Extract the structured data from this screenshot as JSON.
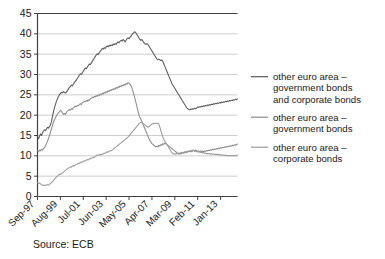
{
  "source_note": "Source: ECB",
  "chart_data": {
    "type": "line",
    "title": "",
    "subtitle": "",
    "xlabel": "",
    "ylabel": "",
    "ylim": [
      0,
      45
    ],
    "ytick_values": [
      0,
      5,
      10,
      15,
      20,
      25,
      30,
      35,
      40,
      45
    ],
    "ytick_labels": [
      "0",
      "5",
      "10",
      "15",
      "20",
      "25",
      "30",
      "35",
      "40",
      "45"
    ],
    "xtick_labels": [
      "Sep-97",
      "Aug-99",
      "Jul-01",
      "Jun-03",
      "May-05",
      "Apr-07",
      "Mar-09",
      "Feb-11",
      "Jan-13"
    ],
    "xtick_indices": [
      0,
      23,
      46,
      69,
      92,
      115,
      138,
      161,
      184
    ],
    "x_start_label": "Sep-97",
    "x_end_label": "mid-2014",
    "n_points": 202,
    "grid": true,
    "grid_axis": "y",
    "legend_position": "right",
    "colors": {
      "series_1": "#595959",
      "series_2": "#8c8c8c",
      "series_3": "#9a9a9a",
      "gridline": "#c8c8c8",
      "axis": "#404040",
      "background": "#ffffff"
    },
    "series": [
      {
        "name": "other euro area – government bonds and corporate bonds",
        "legend_label_lines": [
          "other euro area –",
          "government bonds",
          "and corporate bonds"
        ],
        "color": "#595959",
        "values": [
          14.6,
          14.2,
          14.8,
          15.4,
          15.0,
          15.6,
          16.1,
          16.4,
          16.2,
          16.6,
          17.0,
          16.8,
          17.2,
          17.6,
          18.4,
          19.6,
          20.8,
          21.8,
          22.6,
          23.4,
          24.0,
          24.6,
          25.0,
          25.3,
          25.6,
          25.5,
          25.8,
          25.6,
          25.4,
          25.6,
          26.0,
          26.4,
          26.8,
          27.0,
          27.4,
          27.2,
          27.6,
          28.0,
          28.3,
          28.6,
          29.0,
          29.4,
          29.8,
          30.2,
          30.0,
          30.4,
          30.8,
          31.2,
          31.6,
          31.4,
          31.8,
          32.2,
          32.6,
          32.4,
          32.8,
          33.2,
          33.6,
          34.0,
          34.4,
          34.8,
          35.1,
          34.9,
          35.3,
          35.7,
          36.0,
          36.4,
          36.2,
          36.6,
          36.4,
          36.8,
          37.0,
          36.8,
          37.2,
          37.0,
          37.3,
          37.1,
          37.5,
          37.3,
          37.6,
          37.4,
          37.8,
          38.0,
          37.8,
          38.2,
          38.4,
          38.2,
          38.6,
          38.4,
          38.0,
          38.4,
          38.8,
          39.0,
          38.8,
          39.2,
          39.4,
          39.8,
          40.1,
          40.4,
          40.5,
          40.2,
          39.8,
          39.4,
          39.0,
          38.6,
          38.4,
          38.6,
          38.2,
          37.8,
          37.6,
          37.4,
          37.6,
          37.4,
          37.0,
          36.6,
          36.2,
          35.8,
          35.4,
          35.0,
          34.6,
          34.2,
          33.8,
          33.6,
          33.8,
          33.6,
          33.4,
          33.6,
          33.2,
          32.6,
          32.0,
          31.4,
          30.8,
          30.2,
          29.6,
          29.0,
          28.4,
          27.8,
          27.4,
          27.0,
          26.6,
          26.2,
          25.8,
          25.4,
          25.0,
          24.6,
          24.2,
          23.8,
          23.4,
          23.0,
          22.6,
          22.2,
          21.8,
          21.6,
          21.4,
          21.3,
          21.5,
          21.4,
          21.6,
          21.5,
          21.7,
          21.6,
          21.8,
          22.0,
          21.9,
          22.1,
          22.0,
          22.2,
          22.1,
          22.3,
          22.2,
          22.4,
          22.3,
          22.5,
          22.4,
          22.6,
          22.5,
          22.7,
          22.6,
          22.8,
          22.7,
          22.9,
          22.8,
          23.0,
          22.9,
          23.1,
          23.0,
          23.2,
          23.1,
          23.3,
          23.2,
          23.4,
          23.3,
          23.5,
          23.4,
          23.6,
          23.5,
          23.7,
          23.6,
          23.8,
          23.7,
          23.9,
          23.8,
          24.0
        ]
      },
      {
        "name": "other euro area – government bonds",
        "legend_label_lines": [
          "other euro area –",
          "government bonds"
        ],
        "color": "#8c8c8c",
        "values": [
          11.2,
          11.0,
          11.4,
          11.2,
          11.6,
          11.4,
          11.8,
          12.0,
          12.4,
          13.0,
          13.6,
          14.2,
          15.0,
          15.8,
          16.6,
          17.4,
          18.2,
          18.8,
          19.4,
          19.8,
          20.2,
          20.6,
          20.8,
          21.2,
          21.0,
          20.6,
          20.2,
          20.4,
          20.2,
          20.6,
          21.0,
          21.2,
          21.4,
          21.2,
          21.6,
          21.4,
          21.8,
          22.0,
          22.2,
          22.1,
          22.4,
          22.3,
          22.6,
          22.8,
          22.6,
          23.0,
          23.2,
          23.4,
          23.3,
          23.6,
          23.4,
          23.8,
          23.6,
          24.0,
          24.2,
          24.4,
          24.3,
          24.6,
          24.5,
          24.8,
          24.6,
          25.0,
          24.8,
          25.2,
          25.0,
          25.4,
          25.2,
          25.6,
          25.4,
          25.8,
          25.6,
          26.0,
          25.8,
          26.2,
          26.0,
          26.4,
          26.2,
          26.6,
          26.4,
          26.8,
          26.6,
          27.0,
          26.8,
          27.2,
          27.0,
          27.4,
          27.2,
          27.6,
          27.4,
          27.8,
          27.6,
          28.0,
          27.8,
          27.6,
          27.2,
          26.6,
          25.8,
          25.0,
          24.0,
          23.0,
          22.0,
          21.0,
          20.0,
          19.4,
          19.0,
          18.4,
          17.8,
          17.2,
          16.6,
          16.0,
          15.4,
          14.8,
          14.2,
          13.8,
          13.4,
          13.0,
          12.8,
          12.6,
          12.4,
          12.2,
          12.4,
          12.2,
          12.6,
          12.4,
          12.8,
          12.6,
          13.0,
          12.8,
          13.2,
          13.0,
          12.8,
          12.6,
          12.4,
          12.2,
          12.0,
          11.8,
          11.6,
          11.4,
          11.2,
          11.0,
          10.8,
          10.6,
          10.4,
          10.6,
          10.4,
          10.6,
          10.8,
          10.6,
          10.8,
          11.0,
          10.8,
          11.0,
          11.2,
          11.0,
          11.2,
          11.0,
          11.2,
          11.4,
          11.2,
          11.4,
          11.2,
          11.0,
          11.2,
          11.0,
          11.2,
          11.0,
          11.2,
          11.0,
          11.2,
          11.1,
          11.3,
          11.2,
          11.4,
          11.3,
          11.5,
          11.4,
          11.6,
          11.5,
          11.7,
          11.6,
          11.8,
          11.7,
          11.9,
          11.8,
          12.0,
          11.9,
          12.1,
          12.0,
          12.2,
          12.1,
          12.3,
          12.2,
          12.4,
          12.3,
          12.5,
          12.4,
          12.6,
          12.5,
          12.7,
          12.6,
          12.8,
          12.9
        ]
      },
      {
        "name": "other euro area – corporate bonds",
        "legend_label_lines": [
          "other euro area –",
          "corporate bonds"
        ],
        "color": "#9a9a9a",
        "values": [
          3.4,
          3.2,
          3.3,
          3.1,
          2.9,
          2.8,
          2.7,
          2.8,
          2.7,
          2.8,
          2.9,
          2.8,
          3.0,
          3.2,
          3.4,
          3.6,
          3.9,
          4.2,
          4.5,
          4.8,
          5.0,
          5.2,
          5.5,
          5.4,
          5.6,
          5.8,
          6.0,
          6.2,
          6.4,
          6.6,
          6.8,
          7.0,
          7.1,
          7.3,
          7.2,
          7.4,
          7.6,
          7.5,
          7.7,
          7.9,
          8.0,
          8.2,
          8.1,
          8.3,
          8.5,
          8.4,
          8.6,
          8.8,
          8.7,
          8.9,
          9.1,
          9.0,
          9.2,
          9.4,
          9.3,
          9.5,
          9.7,
          9.6,
          9.8,
          10.0,
          10.2,
          10.1,
          10.3,
          10.2,
          10.4,
          10.3,
          10.5,
          10.7,
          10.6,
          10.8,
          11.0,
          10.9,
          11.1,
          11.3,
          11.2,
          11.4,
          11.6,
          11.8,
          12.0,
          12.2,
          12.4,
          12.6,
          12.8,
          13.0,
          13.2,
          13.4,
          13.6,
          13.8,
          14.0,
          14.2,
          14.4,
          14.6,
          14.9,
          15.2,
          15.5,
          15.8,
          16.1,
          16.4,
          16.7,
          17.0,
          17.3,
          17.6,
          17.9,
          18.1,
          18.3,
          18.2,
          18.0,
          17.8,
          17.6,
          17.4,
          17.2,
          17.0,
          17.2,
          17.4,
          17.6,
          17.8,
          17.9,
          18.0,
          17.9,
          18.0,
          17.9,
          18.0,
          17.8,
          17.0,
          16.2,
          15.4,
          14.6,
          14.0,
          13.6,
          13.2,
          12.8,
          12.4,
          12.0,
          11.6,
          11.2,
          10.8,
          10.6,
          10.4,
          10.5,
          10.4,
          10.6,
          10.5,
          10.7,
          10.6,
          10.8,
          10.7,
          10.9,
          10.8,
          11.0,
          10.9,
          11.1,
          11.0,
          11.2,
          11.1,
          11.3,
          11.2,
          11.4,
          11.3,
          11.1,
          11.2,
          11.0,
          11.1,
          10.9,
          11.0,
          10.8,
          10.9,
          10.7,
          10.8,
          10.6,
          10.7,
          10.5,
          10.6,
          10.5,
          10.6,
          10.4,
          10.5,
          10.4,
          10.5,
          10.3,
          10.4,
          10.3,
          10.4,
          10.2,
          10.3,
          10.2,
          10.3,
          10.1,
          10.2,
          10.1,
          10.2,
          10.0,
          10.1,
          10.0,
          10.1,
          10.0,
          10.1,
          10.0,
          10.1,
          10.0,
          10.1,
          10.0,
          10.2
        ]
      }
    ]
  }
}
